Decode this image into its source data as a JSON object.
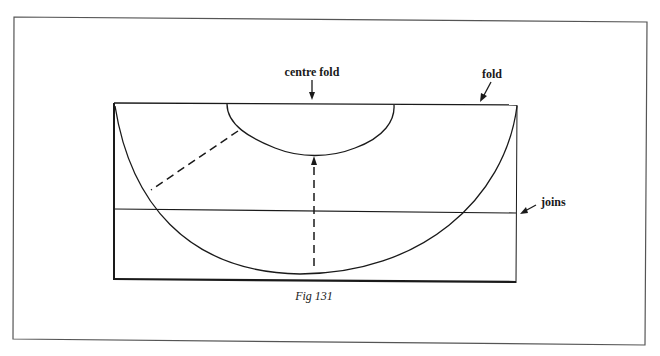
{
  "figure": {
    "caption": "Fig 131",
    "labels": {
      "centre_fold": "centre fold",
      "fold": "fold",
      "joins": "joins"
    }
  },
  "colors": {
    "ink": "#1a1a1a",
    "frame": "#555555",
    "background": "#ffffff"
  }
}
